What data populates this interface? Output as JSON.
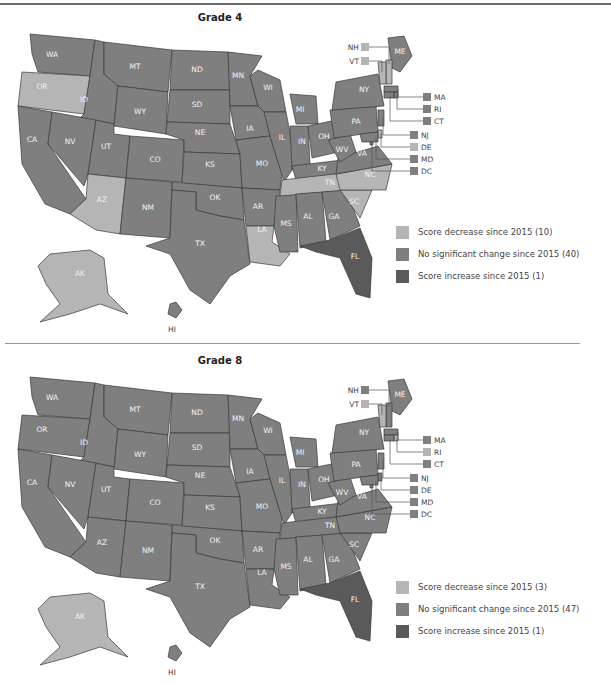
{
  "colors": {
    "decrease": "#b5b5b5",
    "no_change": "#7f7f7f",
    "increase": "#5a5a5a"
  },
  "panels": [
    {
      "title": "Grade 4",
      "legend": [
        {
          "key": "decrease",
          "label": "Score decrease since 2015 (10)"
        },
        {
          "key": "no_change",
          "label": "No significant change since 2015 (40)"
        },
        {
          "key": "increase",
          "label": "Score increase since 2015 (1)"
        }
      ],
      "states": {
        "WA": "no_change",
        "OR": "decrease",
        "CA": "no_change",
        "ID": "no_change",
        "NV": "no_change",
        "MT": "no_change",
        "WY": "no_change",
        "UT": "no_change",
        "AZ": "decrease",
        "CO": "no_change",
        "NM": "no_change",
        "ND": "no_change",
        "SD": "no_change",
        "NE": "no_change",
        "KS": "no_change",
        "OK": "no_change",
        "TX": "no_change",
        "MN": "no_change",
        "IA": "no_change",
        "MO": "no_change",
        "AR": "no_change",
        "LA": "decrease",
        "WI": "no_change",
        "IL": "no_change",
        "MS": "no_change",
        "MI": "no_change",
        "IN": "no_change",
        "KY": "no_change",
        "TN": "decrease",
        "AL": "no_change",
        "OH": "no_change",
        "GA": "no_change",
        "FL": "increase",
        "SC": "decrease",
        "NC": "decrease",
        "VA": "no_change",
        "WV": "no_change",
        "PA": "no_change",
        "NY": "no_change",
        "ME": "no_change",
        "NH": "decrease",
        "VT": "decrease",
        "MA": "no_change",
        "RI": "no_change",
        "CT": "no_change",
        "NJ": "no_change",
        "DE": "decrease",
        "MD": "no_change",
        "DC": "no_change",
        "AK": "decrease",
        "HI": "no_change"
      }
    },
    {
      "title": "Grade 8",
      "legend": [
        {
          "key": "decrease",
          "label": "Score decrease since 2015 (3)"
        },
        {
          "key": "no_change",
          "label": "No significant change since 2015 (47)"
        },
        {
          "key": "increase",
          "label": "Score increase since 2015 (1)"
        }
      ],
      "states": {
        "WA": "no_change",
        "OR": "no_change",
        "CA": "no_change",
        "ID": "no_change",
        "NV": "no_change",
        "MT": "no_change",
        "WY": "no_change",
        "UT": "no_change",
        "AZ": "no_change",
        "CO": "no_change",
        "NM": "no_change",
        "ND": "no_change",
        "SD": "no_change",
        "NE": "no_change",
        "KS": "no_change",
        "OK": "no_change",
        "TX": "no_change",
        "MN": "no_change",
        "IA": "no_change",
        "MO": "no_change",
        "AR": "no_change",
        "LA": "no_change",
        "WI": "no_change",
        "IL": "no_change",
        "MS": "no_change",
        "MI": "no_change",
        "IN": "no_change",
        "KY": "no_change",
        "TN": "no_change",
        "AL": "no_change",
        "OH": "no_change",
        "GA": "no_change",
        "FL": "increase",
        "SC": "no_change",
        "NC": "no_change",
        "VA": "no_change",
        "WV": "no_change",
        "PA": "no_change",
        "NY": "no_change",
        "ME": "no_change",
        "NH": "no_change",
        "VT": "decrease",
        "MA": "no_change",
        "RI": "decrease",
        "CT": "no_change",
        "NJ": "no_change",
        "DE": "no_change",
        "MD": "no_change",
        "DC": "no_change",
        "AK": "decrease",
        "HI": "no_change"
      }
    }
  ],
  "callout_labels": {
    "top_left": [
      "NH",
      "VT"
    ],
    "right_upper": [
      "MA",
      "RI",
      "CT"
    ],
    "right_lower": [
      "NJ",
      "DE",
      "MD",
      "DC"
    ]
  }
}
